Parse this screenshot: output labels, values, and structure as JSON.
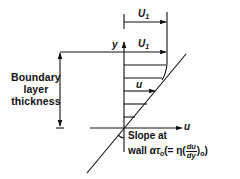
{
  "diagram": {
    "colors": {
      "line": "#111111",
      "background": "#ffffff"
    },
    "axes": {
      "y_label": "y",
      "x_label": "u"
    },
    "labels": {
      "free_stream_top": {
        "symbol": "U",
        "subscript": "1"
      },
      "free_stream_edge": {
        "symbol": "U",
        "subscript": "1"
      },
      "local_velocity": "u",
      "boundary_layer": [
        "Boundary",
        "layer",
        "thickness"
      ],
      "slope_line1": "Slope at",
      "slope_line2_prefix": "wall ",
      "slope_alpha": "α",
      "slope_tau": "τ",
      "slope_tau_sub": "o",
      "slope_open": "(= η(",
      "frac_num": "du",
      "frac_den": "dy",
      "slope_close": ")",
      "slope_close_sub": "o",
      "slope_end": ")"
    }
  }
}
